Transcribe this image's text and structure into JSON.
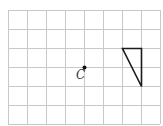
{
  "diagram": {
    "type": "grid-rotation-figure",
    "grid": {
      "columns": 8,
      "rows": 6,
      "x_lines": [
        8,
        27,
        46,
        65,
        84,
        103,
        122,
        141,
        160
      ],
      "y_lines": [
        10,
        29,
        48,
        67,
        86,
        105,
        124
      ],
      "line_color": "#c8c8c8"
    },
    "center_point": {
      "label": "C",
      "x": 84,
      "y": 67,
      "label_x": 76,
      "label_y": 79
    },
    "triangle": {
      "vertices": [
        [
          122,
          48
        ],
        [
          141,
          48
        ],
        [
          141,
          86
        ]
      ],
      "stroke_color": "#1a1a1a"
    }
  }
}
